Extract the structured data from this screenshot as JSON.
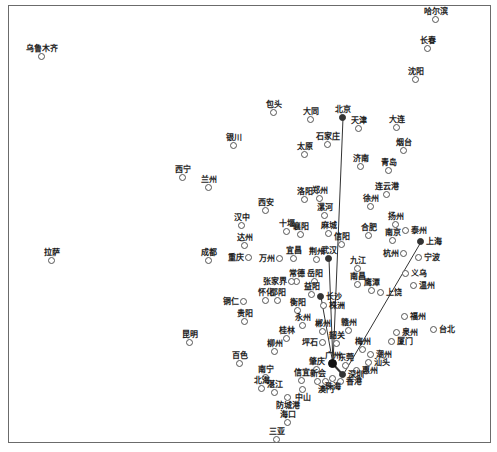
{
  "diagram": {
    "type": "city-network-map",
    "frame": {
      "x": 8,
      "y": 5,
      "w": 483,
      "h": 438,
      "border_color": "#6b6b6b"
    },
    "hub_color": "#333333",
    "line_color": "#333333",
    "cities": [
      {
        "name": "哈尔滨",
        "x": 436,
        "y": 20,
        "pos": "above"
      },
      {
        "name": "长春",
        "x": 428,
        "y": 49,
        "pos": "above"
      },
      {
        "name": "沈阳",
        "x": 416,
        "y": 80,
        "pos": "above"
      },
      {
        "name": "乌鲁木齐",
        "x": 42,
        "y": 57,
        "pos": "above"
      },
      {
        "name": "包头",
        "x": 274,
        "y": 113,
        "pos": "above"
      },
      {
        "name": "大同",
        "x": 311,
        "y": 120,
        "pos": "above"
      },
      {
        "name": "北京",
        "x": 343,
        "y": 118,
        "pos": "above",
        "hub": true
      },
      {
        "name": "天津",
        "x": 359,
        "y": 129,
        "pos": "above"
      },
      {
        "name": "大连",
        "x": 397,
        "y": 128,
        "pos": "above"
      },
      {
        "name": "石家庄",
        "x": 328,
        "y": 145,
        "pos": "above"
      },
      {
        "name": "太原",
        "x": 305,
        "y": 155,
        "pos": "above"
      },
      {
        "name": "烟台",
        "x": 404,
        "y": 151,
        "pos": "above"
      },
      {
        "name": "银川",
        "x": 234,
        "y": 146,
        "pos": "above"
      },
      {
        "name": "济南",
        "x": 361,
        "y": 167,
        "pos": "above"
      },
      {
        "name": "青岛",
        "x": 389,
        "y": 171,
        "pos": "above"
      },
      {
        "name": "西宁",
        "x": 183,
        "y": 178,
        "pos": "above"
      },
      {
        "name": "兰州",
        "x": 209,
        "y": 188,
        "pos": "above"
      },
      {
        "name": "连云港",
        "x": 387,
        "y": 195,
        "pos": "above"
      },
      {
        "name": "洛阳",
        "x": 305,
        "y": 200,
        "pos": "above"
      },
      {
        "name": "郑州",
        "x": 320,
        "y": 199,
        "pos": "above"
      },
      {
        "name": "西安",
        "x": 266,
        "y": 211,
        "pos": "above"
      },
      {
        "name": "徐州",
        "x": 371,
        "y": 207,
        "pos": "above"
      },
      {
        "name": "漯河",
        "x": 325,
        "y": 216,
        "pos": "above"
      },
      {
        "name": "汉中",
        "x": 242,
        "y": 226,
        "pos": "above"
      },
      {
        "name": "十堰",
        "x": 287,
        "y": 232,
        "pos": "above"
      },
      {
        "name": "襄阳",
        "x": 301,
        "y": 235,
        "pos": "above"
      },
      {
        "name": "麻城",
        "x": 329,
        "y": 234,
        "pos": "above"
      },
      {
        "name": "扬州",
        "x": 396,
        "y": 225,
        "pos": "above"
      },
      {
        "name": "合肥",
        "x": 369,
        "y": 236,
        "pos": "above"
      },
      {
        "name": "南京",
        "x": 393,
        "y": 241,
        "pos": "above"
      },
      {
        "name": "泰州",
        "x": 406,
        "y": 231,
        "pos": "right"
      },
      {
        "name": "信阳",
        "x": 342,
        "y": 245,
        "pos": "above"
      },
      {
        "name": "达州",
        "x": 245,
        "y": 246,
        "pos": "above"
      },
      {
        "name": "拉萨",
        "x": 52,
        "y": 261,
        "pos": "above"
      },
      {
        "name": "成都",
        "x": 209,
        "y": 261,
        "pos": "above"
      },
      {
        "name": "重庆",
        "x": 249,
        "y": 258,
        "pos": "left"
      },
      {
        "name": "万州",
        "x": 280,
        "y": 259,
        "pos": "left"
      },
      {
        "name": "宜昌",
        "x": 294,
        "y": 259,
        "pos": "above"
      },
      {
        "name": "荆州",
        "x": 317,
        "y": 260,
        "pos": "above"
      },
      {
        "name": "武汉",
        "x": 329,
        "y": 259,
        "pos": "above",
        "hub": true
      },
      {
        "name": "上海",
        "x": 421,
        "y": 242,
        "pos": "right",
        "hub": true
      },
      {
        "name": "杭州",
        "x": 404,
        "y": 254,
        "pos": "left"
      },
      {
        "name": "宁波",
        "x": 419,
        "y": 258,
        "pos": "right"
      },
      {
        "name": "九江",
        "x": 358,
        "y": 269,
        "pos": "above"
      },
      {
        "name": "义乌",
        "x": 406,
        "y": 274,
        "pos": "right"
      },
      {
        "name": "常德",
        "x": 297,
        "y": 282,
        "pos": "above"
      },
      {
        "name": "岳阳",
        "x": 315,
        "y": 282,
        "pos": "above"
      },
      {
        "name": "张家界",
        "x": 292,
        "y": 282,
        "pos": "left"
      },
      {
        "name": "温州",
        "x": 414,
        "y": 286,
        "pos": "right"
      },
      {
        "name": "南昌",
        "x": 358,
        "y": 285,
        "pos": "above"
      },
      {
        "name": "鹰潭",
        "x": 372,
        "y": 291,
        "pos": "above"
      },
      {
        "name": "上饶",
        "x": 381,
        "y": 293,
        "pos": "right"
      },
      {
        "name": "益阳",
        "x": 312,
        "y": 295,
        "pos": "above"
      },
      {
        "name": "长沙",
        "x": 321,
        "y": 297,
        "pos": "right",
        "hub": true
      },
      {
        "name": "怀化",
        "x": 266,
        "y": 301,
        "pos": "above"
      },
      {
        "name": "邵阳",
        "x": 278,
        "y": 301,
        "pos": "above"
      },
      {
        "name": "铜仁",
        "x": 244,
        "y": 302,
        "pos": "left"
      },
      {
        "name": "株洲",
        "x": 324,
        "y": 306,
        "pos": "right"
      },
      {
        "name": "衡阳",
        "x": 298,
        "y": 311,
        "pos": "above"
      },
      {
        "name": "贵阳",
        "x": 245,
        "y": 322,
        "pos": "above"
      },
      {
        "name": "永州",
        "x": 303,
        "y": 326,
        "pos": "above"
      },
      {
        "name": "福州",
        "x": 405,
        "y": 317,
        "pos": "right"
      },
      {
        "name": "郴州",
        "x": 323,
        "y": 332,
        "pos": "above"
      },
      {
        "name": "赣州",
        "x": 349,
        "y": 331,
        "pos": "above"
      },
      {
        "name": "台北",
        "x": 434,
        "y": 330,
        "pos": "right"
      },
      {
        "name": "泉州",
        "x": 397,
        "y": 333,
        "pos": "right"
      },
      {
        "name": "厦门",
        "x": 392,
        "y": 342,
        "pos": "right"
      },
      {
        "name": "桂林",
        "x": 287,
        "y": 339,
        "pos": "above"
      },
      {
        "name": "韶关",
        "x": 337,
        "y": 344,
        "pos": "above"
      },
      {
        "name": "坪石",
        "x": 323,
        "y": 343,
        "pos": "left"
      },
      {
        "name": "昆明",
        "x": 190,
        "y": 343,
        "pos": "above"
      },
      {
        "name": "梅州",
        "x": 363,
        "y": 350,
        "pos": "above"
      },
      {
        "name": "柳州",
        "x": 275,
        "y": 352,
        "pos": "above"
      },
      {
        "name": "潮州",
        "x": 371,
        "y": 355,
        "pos": "right"
      },
      {
        "name": "百色",
        "x": 240,
        "y": 364,
        "pos": "above"
      },
      {
        "name": "汕头",
        "x": 369,
        "y": 363,
        "pos": "right"
      },
      {
        "name": "肇庆",
        "x": 317,
        "y": 370,
        "pos": "above"
      },
      {
        "name": "广州",
        "x": 333,
        "y": 364,
        "pos": "above",
        "hub": true,
        "big": true
      },
      {
        "name": "东莞",
        "x": 346,
        "y": 366,
        "pos": "above"
      },
      {
        "name": "惠州",
        "x": 357,
        "y": 371,
        "pos": "right"
      },
      {
        "name": "深圳",
        "x": 343,
        "y": 375,
        "pos": "right",
        "hub": true
      },
      {
        "name": "南宁",
        "x": 266,
        "y": 378,
        "pos": "above"
      },
      {
        "name": "信宜",
        "x": 302,
        "y": 381,
        "pos": "above"
      },
      {
        "name": "香港",
        "x": 341,
        "y": 382,
        "pos": "right"
      },
      {
        "name": "新会",
        "x": 318,
        "y": 382,
        "pos": "above"
      },
      {
        "name": "澳门",
        "x": 326,
        "y": 382,
        "pos": "below-label"
      },
      {
        "name": "珠海",
        "x": 333,
        "y": 379,
        "pos": "below-label"
      },
      {
        "name": "北海",
        "x": 262,
        "y": 389,
        "pos": "above"
      },
      {
        "name": "湛江",
        "x": 275,
        "y": 393,
        "pos": "above"
      },
      {
        "name": "中山",
        "x": 303,
        "y": 390,
        "pos": "below-label"
      },
      {
        "name": "防城港",
        "x": 288,
        "y": 398,
        "pos": "below-label"
      },
      {
        "name": "海口",
        "x": 288,
        "y": 423,
        "pos": "above"
      },
      {
        "name": "三亚",
        "x": 277,
        "y": 440,
        "pos": "above"
      }
    ],
    "edges": [
      {
        "from": "北京",
        "to": "广州"
      },
      {
        "from": "武汉",
        "to": "广州"
      },
      {
        "from": "长沙",
        "to": "广州"
      },
      {
        "from": "上海",
        "to": "深圳"
      },
      {
        "from": "广州",
        "to": "深圳"
      }
    ]
  }
}
